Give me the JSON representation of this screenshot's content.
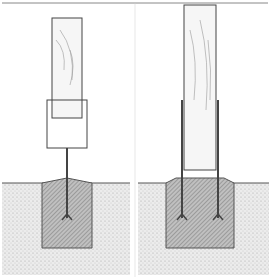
{
  "figure": {
    "panels": [
      {
        "name": "single-strap-anchor",
        "description": "Post set in anchor with single center rod into concrete footing"
      },
      {
        "name": "double-strap-anchor",
        "description": "Post set in anchor with two side straps into concrete footing"
      }
    ],
    "colors": {
      "ink": "#333333",
      "soil": "#dcdcdc",
      "concrete": "#a8a8a8",
      "wood": "#f4f4f4"
    }
  }
}
